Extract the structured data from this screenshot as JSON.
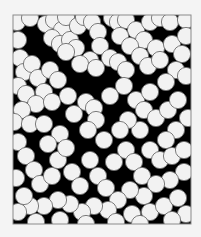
{
  "figure": {
    "frame": {
      "x": 13,
      "y": 15,
      "width": 178,
      "height": 209
    },
    "colors": {
      "background": "#f4f4f4",
      "field": "#000000",
      "disk_fill": "#f2f2f2",
      "disk_stroke": "#6e6e6e",
      "frame_stroke": "#8a8a8a"
    },
    "disk_radius": 8.6,
    "disks": [
      [
        17,
        22
      ],
      [
        18,
        40
      ],
      [
        30,
        18
      ],
      [
        46,
        24
      ],
      [
        54,
        20
      ],
      [
        62,
        30
      ],
      [
        66,
        17
      ],
      [
        52,
        38
      ],
      [
        60,
        44
      ],
      [
        70,
        40
      ],
      [
        78,
        26
      ],
      [
        84,
        17
      ],
      [
        76,
        48
      ],
      [
        66,
        52
      ],
      [
        92,
        22
      ],
      [
        98,
        32
      ],
      [
        112,
        18
      ],
      [
        118,
        22
      ],
      [
        126,
        20
      ],
      [
        136,
        30
      ],
      [
        150,
        22
      ],
      [
        160,
        18
      ],
      [
        170,
        22
      ],
      [
        186,
        20
      ],
      [
        144,
        40
      ],
      [
        156,
        48
      ],
      [
        120,
        36
      ],
      [
        130,
        46
      ],
      [
        100,
        46
      ],
      [
        110,
        58
      ],
      [
        90,
        60
      ],
      [
        80,
        64
      ],
      [
        96,
        68
      ],
      [
        118,
        62
      ],
      [
        126,
        70
      ],
      [
        140,
        56
      ],
      [
        148,
        66
      ],
      [
        160,
        60
      ],
      [
        172,
        44
      ],
      [
        186,
        36
      ],
      [
        182,
        54
      ],
      [
        176,
        70
      ],
      [
        186,
        76
      ],
      [
        166,
        82
      ],
      [
        20,
        58
      ],
      [
        24,
        72
      ],
      [
        32,
        64
      ],
      [
        38,
        78
      ],
      [
        18,
        86
      ],
      [
        26,
        94
      ],
      [
        44,
        92
      ],
      [
        36,
        104
      ],
      [
        52,
        102
      ],
      [
        22,
        110
      ],
      [
        14,
        122
      ],
      [
        30,
        124
      ],
      [
        50,
        70
      ],
      [
        58,
        80
      ],
      [
        68,
        96
      ],
      [
        74,
        114
      ],
      [
        86,
        102
      ],
      [
        94,
        108
      ],
      [
        96,
        120
      ],
      [
        88,
        130
      ],
      [
        104,
        140
      ],
      [
        110,
        96
      ],
      [
        124,
        86
      ],
      [
        136,
        100
      ],
      [
        144,
        110
      ],
      [
        150,
        92
      ],
      [
        156,
        118
      ],
      [
        168,
        110
      ],
      [
        178,
        100
      ],
      [
        188,
        118
      ],
      [
        176,
        130
      ],
      [
        166,
        140
      ],
      [
        140,
        130
      ],
      [
        128,
        120
      ],
      [
        120,
        130
      ],
      [
        44,
        124
      ],
      [
        60,
        134
      ],
      [
        48,
        144
      ],
      [
        18,
        142
      ],
      [
        26,
        156
      ],
      [
        34,
        170
      ],
      [
        16,
        178
      ],
      [
        40,
        184
      ],
      [
        52,
        176
      ],
      [
        58,
        160
      ],
      [
        66,
        148
      ],
      [
        72,
        172
      ],
      [
        80,
        186
      ],
      [
        90,
        160
      ],
      [
        98,
        176
      ],
      [
        106,
        188
      ],
      [
        114,
        162
      ],
      [
        126,
        150
      ],
      [
        134,
        162
      ],
      [
        142,
        176
      ],
      [
        150,
        150
      ],
      [
        160,
        160
      ],
      [
        172,
        156
      ],
      [
        184,
        150
      ],
      [
        184,
        172
      ],
      [
        170,
        180
      ],
      [
        156,
        184
      ],
      [
        144,
        196
      ],
      [
        130,
        190
      ],
      [
        118,
        200
      ],
      [
        108,
        210
      ],
      [
        94,
        206
      ],
      [
        82,
        212
      ],
      [
        70,
        204
      ],
      [
        58,
        200
      ],
      [
        44,
        206
      ],
      [
        30,
        206
      ],
      [
        18,
        212
      ],
      [
        24,
        196
      ],
      [
        132,
        214
      ],
      [
        150,
        212
      ],
      [
        164,
        206
      ],
      [
        178,
        198
      ],
      [
        186,
        214
      ],
      [
        172,
        220
      ],
      [
        140,
        224
      ],
      [
        116,
        222
      ],
      [
        86,
        224
      ],
      [
        60,
        220
      ],
      [
        36,
        222
      ]
    ]
  }
}
